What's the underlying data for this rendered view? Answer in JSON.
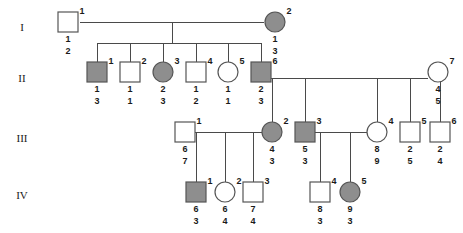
{
  "figure": {
    "type": "pedigree-chart",
    "symbol_fill_affected": "#8e8e8e",
    "symbol_fill_unaffected": "#ffffff",
    "symbol_stroke": "#555555",
    "line_color": "#4a4a4a",
    "width": 463,
    "height": 233
  },
  "generation_labels": [
    {
      "text": "I",
      "x": 22,
      "y": 28
    },
    {
      "text": "II",
      "x": 22,
      "y": 79
    },
    {
      "text": "III",
      "x": 22,
      "y": 139
    },
    {
      "text": "IV",
      "x": 22,
      "y": 196
    }
  ],
  "individuals": [
    {
      "gen": "I",
      "id": "1",
      "shape": "square",
      "affected": false,
      "cx": 68,
      "cy": 22,
      "alleles": [
        "1",
        "2"
      ]
    },
    {
      "gen": "I",
      "id": "2",
      "shape": "circle",
      "affected": true,
      "cx": 275,
      "cy": 22,
      "alleles": [
        "1",
        "3"
      ]
    },
    {
      "gen": "II",
      "id": "1",
      "shape": "square",
      "affected": true,
      "cx": 97,
      "cy": 72,
      "alleles": [
        "1",
        "3"
      ]
    },
    {
      "gen": "II",
      "id": "2",
      "shape": "square",
      "affected": false,
      "cx": 130,
      "cy": 72,
      "alleles": [
        "1",
        "1"
      ]
    },
    {
      "gen": "II",
      "id": "3",
      "shape": "circle",
      "affected": true,
      "cx": 163,
      "cy": 72,
      "alleles": [
        "2",
        "3"
      ]
    },
    {
      "gen": "II",
      "id": "4",
      "shape": "square",
      "affected": false,
      "cx": 196,
      "cy": 72,
      "alleles": [
        "1",
        "2"
      ]
    },
    {
      "gen": "II",
      "id": "5",
      "shape": "circle",
      "affected": false,
      "cx": 228,
      "cy": 72,
      "alleles": [
        "1",
        "1"
      ]
    },
    {
      "gen": "II",
      "id": "6",
      "shape": "square",
      "affected": true,
      "cx": 261,
      "cy": 72,
      "alleles": [
        "2",
        "3"
      ]
    },
    {
      "gen": "II",
      "id": "7",
      "shape": "circle",
      "affected": false,
      "cx": 438,
      "cy": 72,
      "alleles": [
        "4",
        "5"
      ]
    },
    {
      "gen": "III",
      "id": "1",
      "shape": "square",
      "affected": false,
      "cx": 185,
      "cy": 132,
      "alleles": [
        "6",
        "7"
      ]
    },
    {
      "gen": "III",
      "id": "2",
      "shape": "circle",
      "affected": true,
      "cx": 272,
      "cy": 132,
      "alleles": [
        "4",
        "3"
      ]
    },
    {
      "gen": "III",
      "id": "3",
      "shape": "square",
      "affected": true,
      "cx": 305,
      "cy": 132,
      "alleles": [
        "5",
        "3"
      ]
    },
    {
      "gen": "III",
      "id": "4",
      "shape": "circle",
      "affected": false,
      "cx": 377,
      "cy": 132,
      "alleles": [
        "8",
        "9"
      ]
    },
    {
      "gen": "III",
      "id": "5",
      "shape": "square",
      "affected": false,
      "cx": 410,
      "cy": 132,
      "alleles": [
        "2",
        "5"
      ]
    },
    {
      "gen": "III",
      "id": "6",
      "shape": "square",
      "affected": false,
      "cx": 440,
      "cy": 132,
      "alleles": [
        "2",
        "4"
      ]
    },
    {
      "gen": "IV",
      "id": "1",
      "shape": "square",
      "affected": true,
      "cx": 196,
      "cy": 192,
      "alleles": [
        "6",
        "3"
      ]
    },
    {
      "gen": "IV",
      "id": "2",
      "shape": "circle",
      "affected": false,
      "cx": 225,
      "cy": 192,
      "alleles": [
        "6",
        "4"
      ]
    },
    {
      "gen": "IV",
      "id": "3",
      "shape": "square",
      "affected": false,
      "cx": 253,
      "cy": 192,
      "alleles": [
        "7",
        "4"
      ]
    },
    {
      "gen": "IV",
      "id": "4",
      "shape": "square",
      "affected": false,
      "cx": 320,
      "cy": 192,
      "alleles": [
        "8",
        "3"
      ]
    },
    {
      "gen": "IV",
      "id": "5",
      "shape": "circle",
      "affected": true,
      "cx": 350,
      "cy": 192,
      "alleles": [
        "9",
        "3"
      ]
    }
  ],
  "connector_lines": [
    {
      "name": "mating-I1-I2",
      "x1": 80,
      "y1": 22,
      "x2": 264,
      "y2": 22
    },
    {
      "name": "sibship-II",
      "x1": 97,
      "y1": 43,
      "x2": 261,
      "y2": 43
    },
    {
      "name": "drop-I-to-sibship-II",
      "x1": 172,
      "y1": 22,
      "x2": 172,
      "y2": 43
    },
    {
      "name": "drop-II-1",
      "x1": 97,
      "y1": 43,
      "x2": 97,
      "y2": 62
    },
    {
      "name": "drop-II-2",
      "x1": 130,
      "y1": 43,
      "x2": 130,
      "y2": 62
    },
    {
      "name": "drop-II-3",
      "x1": 163,
      "y1": 43,
      "x2": 163,
      "y2": 62
    },
    {
      "name": "drop-II-4",
      "x1": 196,
      "y1": 43,
      "x2": 196,
      "y2": 62
    },
    {
      "name": "drop-II-5",
      "x1": 228,
      "y1": 43,
      "x2": 228,
      "y2": 62
    },
    {
      "name": "drop-II-6",
      "x1": 261,
      "y1": 43,
      "x2": 261,
      "y2": 62
    },
    {
      "name": "mating-II6-II7",
      "x1": 271,
      "y1": 78,
      "x2": 428,
      "y2": 78
    },
    {
      "name": "drop-III-2",
      "x1": 272,
      "y1": 78,
      "x2": 272,
      "y2": 122
    },
    {
      "name": "drop-III-3",
      "x1": 305,
      "y1": 78,
      "x2": 305,
      "y2": 122
    },
    {
      "name": "drop-III-4",
      "x1": 377,
      "y1": 78,
      "x2": 377,
      "y2": 122
    },
    {
      "name": "drop-III-5",
      "x1": 410,
      "y1": 78,
      "x2": 410,
      "y2": 122
    },
    {
      "name": "drop-III-6",
      "x1": 440,
      "y1": 78,
      "x2": 440,
      "y2": 122
    },
    {
      "name": "mating-III1-III2",
      "x1": 195,
      "y1": 132,
      "x2": 262,
      "y2": 132
    },
    {
      "name": "sibship-IV-left",
      "x1": 196,
      "y1": 132,
      "x2": 253,
      "y2": 132
    },
    {
      "name": "drop-IV-1",
      "x1": 196,
      "y1": 132,
      "x2": 196,
      "y2": 182
    },
    {
      "name": "drop-IV-2",
      "x1": 225,
      "y1": 132,
      "x2": 225,
      "y2": 182
    },
    {
      "name": "drop-IV-3",
      "x1": 253,
      "y1": 132,
      "x2": 253,
      "y2": 182
    },
    {
      "name": "mating-III3-III4",
      "x1": 315,
      "y1": 132,
      "x2": 367,
      "y2": 132
    },
    {
      "name": "sibship-IV-right",
      "x1": 320,
      "y1": 132,
      "x2": 350,
      "y2": 132
    },
    {
      "name": "drop-IV-4",
      "x1": 320,
      "y1": 132,
      "x2": 320,
      "y2": 182
    },
    {
      "name": "drop-IV-5",
      "x1": 350,
      "y1": 132,
      "x2": 350,
      "y2": 182
    }
  ]
}
